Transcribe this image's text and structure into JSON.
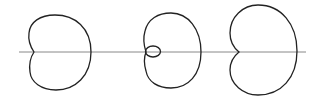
{
  "diagram": {
    "axis": {
      "x1": 19,
      "y": 52,
      "x2": 306,
      "color": "#888888"
    },
    "stroke_color": "#222222",
    "curves": [
      {
        "name": "dimpled-limacon",
        "cx": 59,
        "label": ""
      },
      {
        "name": "looped-limacon",
        "cx": 172,
        "label": ""
      },
      {
        "name": "cardioid",
        "cx": 260,
        "label": ""
      }
    ]
  }
}
